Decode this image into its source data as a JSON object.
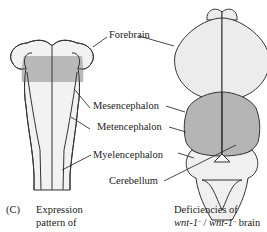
{
  "figure": {
    "panel_letter": "(C)",
    "left_caption": {
      "line1": "Expression",
      "line2": "pattern of"
    },
    "right_caption": {
      "line1": "Deficiencies of",
      "gene_a": "wnt-1",
      "sup_a": "–",
      "slash": " / ",
      "gene_b": "wnt-1",
      "sup_b": "–",
      "tail": " brain"
    }
  },
  "labels": {
    "forebrain": "Forebrain",
    "mesencephalon": "Mesencephalon",
    "metencephalon": "Metencephalon",
    "myelencephalon": "Myelencephalon",
    "cerebellum": "Cerebellum"
  },
  "colors": {
    "outline": "#333333",
    "tissue_light": "#ececec",
    "tissue_white": "#f7f7f7",
    "expression_band": "#b9b9b9",
    "midbrain_shaded": "#b5b5b5"
  }
}
